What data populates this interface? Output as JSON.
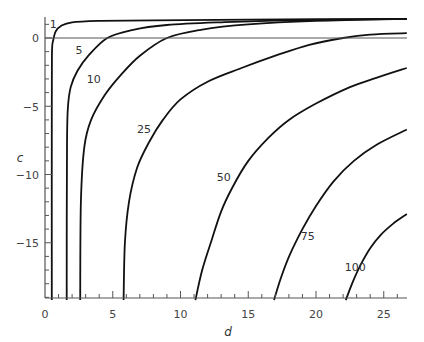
{
  "chart_data": {
    "type": "line",
    "title": "",
    "xlabel": "d",
    "ylabel": "c",
    "xlim": [
      0,
      26.7
    ],
    "ylim": [
      -19.2,
      1.6
    ],
    "grid": false,
    "legend": "none (curves labelled inline)",
    "x_ticks": [
      0,
      5,
      10,
      15,
      20,
      25
    ],
    "y_ticks": [
      0,
      -5,
      -10,
      -15
    ],
    "reference_line": {
      "y": 0
    },
    "series": [
      {
        "name": "1",
        "label_at": [
          0.6,
          1.0
        ],
        "points": [
          [
            0.5,
            -19.2
          ],
          [
            0.5,
            -5
          ],
          [
            0.52,
            -1
          ],
          [
            0.6,
            -0.2
          ],
          [
            0.8,
            0.5
          ],
          [
            1.2,
            0.9
          ],
          [
            2,
            1.15
          ],
          [
            4,
            1.25
          ],
          [
            8,
            1.3
          ],
          [
            15,
            1.35
          ],
          [
            26.7,
            1.4
          ]
        ]
      },
      {
        "name": "5",
        "label_at": [
          2.5,
          -0.9
        ],
        "points": [
          [
            1.6,
            -19.2
          ],
          [
            1.62,
            -8
          ],
          [
            1.7,
            -5
          ],
          [
            1.9,
            -3.6
          ],
          [
            2.4,
            -2.4
          ],
          [
            3.2,
            -1.3
          ],
          [
            4.6,
            0
          ],
          [
            6.5,
            0.6
          ],
          [
            9,
            0.95
          ],
          [
            13,
            1.15
          ],
          [
            18,
            1.3
          ],
          [
            26.7,
            1.4
          ]
        ]
      },
      {
        "name": "10",
        "label_at": [
          3.6,
          -3.0
        ],
        "points": [
          [
            2.6,
            -19.2
          ],
          [
            2.65,
            -12
          ],
          [
            2.9,
            -8
          ],
          [
            3.4,
            -6
          ],
          [
            4.4,
            -4.2
          ],
          [
            5.6,
            -2.7
          ],
          [
            7,
            -1.3
          ],
          [
            9,
            0
          ],
          [
            11.5,
            0.6
          ],
          [
            15,
            1.0
          ],
          [
            20,
            1.25
          ],
          [
            26.7,
            1.4
          ]
        ]
      },
      {
        "name": "25",
        "label_at": [
          7.3,
          -6.7
        ],
        "points": [
          [
            5.8,
            -19.2
          ],
          [
            5.9,
            -15
          ],
          [
            6.2,
            -12
          ],
          [
            6.8,
            -9.5
          ],
          [
            7.7,
            -7.6
          ],
          [
            8.7,
            -6
          ],
          [
            10,
            -4.5
          ],
          [
            12,
            -3.2
          ],
          [
            14.5,
            -2.2
          ],
          [
            17,
            -1.3
          ],
          [
            19.5,
            -0.5
          ],
          [
            22,
            0
          ],
          [
            24,
            0.25
          ],
          [
            26.7,
            0.35
          ]
        ]
      },
      {
        "name": "50",
        "label_at": [
          13.2,
          -10.2
        ],
        "points": [
          [
            11.1,
            -19.2
          ],
          [
            11.6,
            -17
          ],
          [
            12.3,
            -14.8
          ],
          [
            13,
            -12.7
          ],
          [
            13.8,
            -11
          ],
          [
            15,
            -9
          ],
          [
            16.5,
            -7.3
          ],
          [
            18,
            -6
          ],
          [
            20,
            -4.8
          ],
          [
            22.5,
            -3.6
          ],
          [
            24.5,
            -2.9
          ],
          [
            26.7,
            -2.2
          ]
        ]
      },
      {
        "name": "75",
        "label_at": [
          19.4,
          -14.5
        ],
        "points": [
          [
            16.9,
            -19.2
          ],
          [
            17.4,
            -17.6
          ],
          [
            18.1,
            -15.8
          ],
          [
            19,
            -14
          ],
          [
            20,
            -12.3
          ],
          [
            21.3,
            -10.5
          ],
          [
            22.8,
            -9
          ],
          [
            24.5,
            -7.8
          ],
          [
            26.7,
            -6.7
          ]
        ]
      },
      {
        "name": "100",
        "label_at": [
          22.9,
          -16.8
        ],
        "points": [
          [
            22.2,
            -19.2
          ],
          [
            22.7,
            -17.9
          ],
          [
            23.3,
            -16.6
          ],
          [
            24,
            -15.4
          ],
          [
            24.8,
            -14.4
          ],
          [
            25.7,
            -13.6
          ],
          [
            26.7,
            -12.9
          ]
        ]
      }
    ]
  },
  "axes": {
    "x_tick_labels": [
      "0",
      "5",
      "10",
      "15",
      "20",
      "25"
    ],
    "y_tick_labels": [
      "0",
      "−5",
      "−10",
      "−15"
    ],
    "x_title": "d",
    "y_title": "c"
  }
}
